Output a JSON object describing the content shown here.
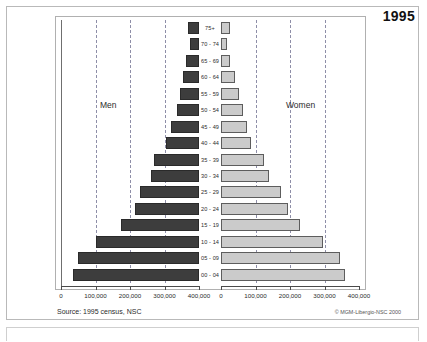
{
  "title_year": "1995",
  "footer": {
    "source": "Source: 1995 census, NSC",
    "copyright": "© MGM-Libergio-NSC 2000"
  },
  "chart_data": {
    "type": "bar",
    "subtype": "population-pyramid",
    "title": "1995",
    "xlabel": "",
    "ylabel": "",
    "grid": true,
    "legend_position": "in-plot",
    "axis_ticks": [
      0,
      100000,
      200000,
      300000,
      400000
    ],
    "tick_labels": [
      "0",
      "100,000",
      "200,000",
      "300,000",
      "400,000"
    ],
    "left_tick_labels": [
      "400,000",
      "300,000",
      "200,000",
      "100,000",
      "0"
    ],
    "xlim": [
      0,
      400000
    ],
    "categories": [
      "75+",
      "70 - 74",
      "65 - 69",
      "60 - 64",
      "55 - 59",
      "50 - 54",
      "45 - 49",
      "40 - 44",
      "35 - 39",
      "30 - 34",
      "25 - 29",
      "20 - 24",
      "15 - 19",
      "10 - 14",
      "05 - 09",
      "00 - 04"
    ],
    "series": [
      {
        "name": "Men",
        "side": "left",
        "color": "#3d3d3d",
        "values": [
          33000,
          25000,
          38000,
          45000,
          55000,
          65000,
          80000,
          95000,
          130000,
          140000,
          170000,
          185000,
          225000,
          300000,
          350000,
          365000
        ]
      },
      {
        "name": "Women",
        "side": "right",
        "color": "#cbcbcb",
        "values": [
          25000,
          18000,
          27000,
          40000,
          52000,
          65000,
          75000,
          88000,
          125000,
          140000,
          175000,
          195000,
          230000,
          295000,
          345000,
          360000
        ]
      }
    ]
  }
}
